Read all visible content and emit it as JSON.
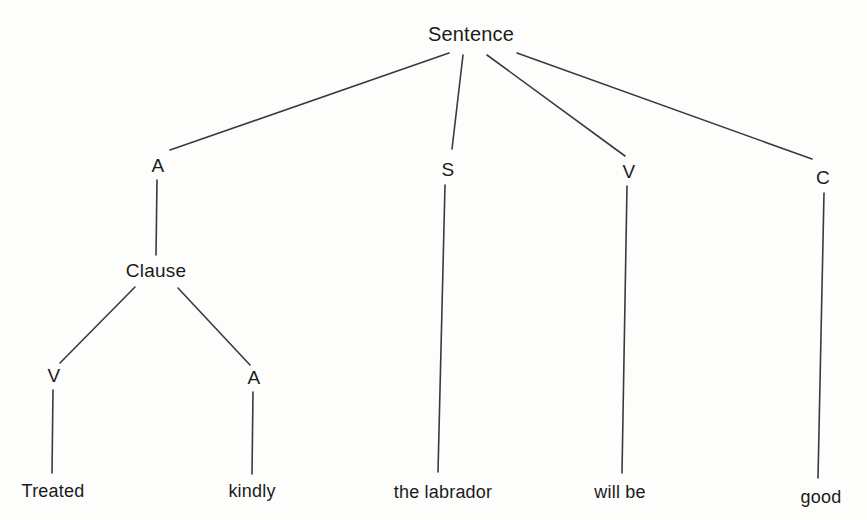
{
  "diagram": {
    "type": "syntax-tree",
    "background_color": "#fdfdfc",
    "line_color": "#3a3a3a",
    "text_color": "#1b1b1b",
    "sentence_text": "Treated kindly the labrador will be good",
    "nodes": [
      {
        "id": "root",
        "label": "Sentence",
        "x": 471,
        "y": 34,
        "kind": "root"
      },
      {
        "id": "adverbial",
        "label": "A",
        "x": 158,
        "y": 166,
        "kind": "category"
      },
      {
        "id": "subject",
        "label": "S",
        "x": 448,
        "y": 170,
        "kind": "category"
      },
      {
        "id": "verb",
        "label": "V",
        "x": 629,
        "y": 172,
        "kind": "category"
      },
      {
        "id": "complement",
        "label": "C",
        "x": 823,
        "y": 178,
        "kind": "category"
      },
      {
        "id": "clause",
        "label": "Clause",
        "x": 156,
        "y": 271,
        "kind": "category"
      },
      {
        "id": "clause-v",
        "label": "V",
        "x": 54,
        "y": 376,
        "kind": "category"
      },
      {
        "id": "clause-a",
        "label": "A",
        "x": 254,
        "y": 378,
        "kind": "category"
      },
      {
        "id": "leaf-treated",
        "label": "Treated",
        "x": 53,
        "y": 491,
        "kind": "leaf"
      },
      {
        "id": "leaf-kindly",
        "label": "kindly",
        "x": 252,
        "y": 491,
        "kind": "leaf"
      },
      {
        "id": "leaf-subj",
        "label": "the labrador",
        "x": 443,
        "y": 492,
        "kind": "leaf"
      },
      {
        "id": "leaf-verb",
        "label": "will be",
        "x": 620,
        "y": 492,
        "kind": "leaf"
      },
      {
        "id": "leaf-comp",
        "label": "good",
        "x": 821,
        "y": 497,
        "kind": "leaf"
      }
    ],
    "edges": [
      {
        "id": "root-to-adverbial",
        "from": "root",
        "to": "adverbial",
        "x1": 449,
        "y1": 53,
        "x2": 170,
        "y2": 150
      },
      {
        "id": "root-to-subject",
        "from": "root",
        "to": "subject",
        "x1": 463,
        "y1": 55,
        "x2": 452,
        "y2": 149
      },
      {
        "id": "root-to-verb",
        "from": "root",
        "to": "verb",
        "x1": 487,
        "y1": 55,
        "x2": 625,
        "y2": 156
      },
      {
        "id": "root-to-complement",
        "from": "root",
        "to": "complement",
        "x1": 517,
        "y1": 53,
        "x2": 812,
        "y2": 159
      },
      {
        "id": "adverbial-to-clause",
        "from": "adverbial",
        "to": "clause",
        "x1": 157,
        "y1": 180,
        "x2": 156,
        "y2": 255
      },
      {
        "id": "clause-to-v",
        "from": "clause",
        "to": "clause-v",
        "x1": 135,
        "y1": 287,
        "x2": 60,
        "y2": 363
      },
      {
        "id": "clause-to-a",
        "from": "clause",
        "to": "clause-a",
        "x1": 178,
        "y1": 288,
        "x2": 250,
        "y2": 365
      },
      {
        "id": "v-to-treated",
        "from": "clause-v",
        "to": "leaf-treated",
        "x1": 53,
        "y1": 390,
        "x2": 52,
        "y2": 473
      },
      {
        "id": "a-to-kindly",
        "from": "clause-a",
        "to": "leaf-kindly",
        "x1": 253,
        "y1": 392,
        "x2": 252,
        "y2": 474
      },
      {
        "id": "s-to-labrador",
        "from": "subject",
        "to": "leaf-subj",
        "x1": 445,
        "y1": 185,
        "x2": 438,
        "y2": 472
      },
      {
        "id": "v-to-willbe",
        "from": "verb",
        "to": "leaf-verb",
        "x1": 627,
        "y1": 186,
        "x2": 622,
        "y2": 473
      },
      {
        "id": "c-to-good",
        "from": "complement",
        "to": "leaf-comp",
        "x1": 824,
        "y1": 193,
        "x2": 818,
        "y2": 478
      }
    ]
  }
}
